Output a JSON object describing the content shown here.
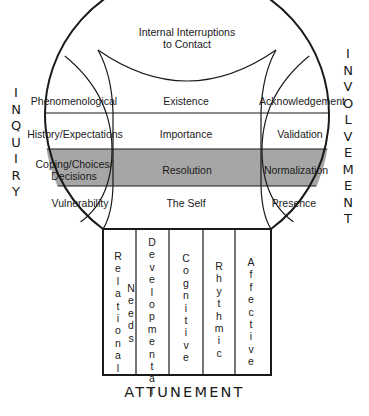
{
  "diagram": {
    "title_bottom": "ATTUNEMENT",
    "left_axis": "INQUIRY",
    "right_axis": "INVOLVEMENT",
    "top_cap": {
      "line1": "Internal Interruptions",
      "line2": "to Contact"
    },
    "rows": [
      {
        "left": "Phenomenological",
        "center": "Existence",
        "right": "Acknowledgement",
        "shaded": false
      },
      {
        "left": "History/Expectations",
        "center": "Importance",
        "right": "Validation",
        "shaded": false
      },
      {
        "left_line1": "Coping/Choices/",
        "left_line2": "Decisions",
        "center": "Resolution",
        "right": "Normalization",
        "shaded": true
      },
      {
        "left": "Vulnerability",
        "center": "The Self",
        "right": "Presence",
        "shaded": false
      }
    ],
    "columns": [
      {
        "label": "Relational",
        "sub": "Needs"
      },
      {
        "label": "Developmental"
      },
      {
        "label": "Cognitive"
      },
      {
        "label": "Rhythmic"
      },
      {
        "label": "Affective"
      }
    ],
    "colors": {
      "line": "#1a1a1a",
      "shade": "#a6a6a6",
      "background": "#ffffff"
    }
  }
}
